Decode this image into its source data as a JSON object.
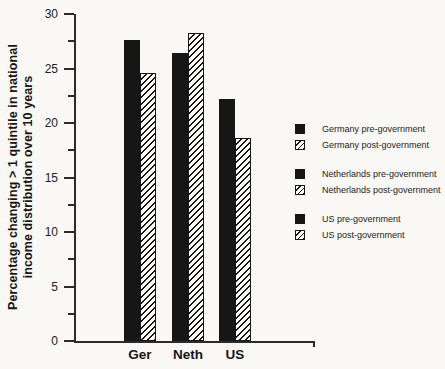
{
  "figure": {
    "paper_color": "#f9f8f5",
    "ink_color": "#161616",
    "axis_color": "#2b2b2b",
    "hatch_fill_color": "#fcfbf8"
  },
  "chart_data": {
    "type": "bar",
    "title": "",
    "ylabel_line1": "Percentage changing > 1 quintile in national",
    "ylabel_line2": "income distribution over 10 years",
    "xlabel": "",
    "categories": [
      "Ger",
      "Neth",
      "US"
    ],
    "series": [
      {
        "name": "pre-government",
        "style": "solid-black",
        "values": [
          27.6,
          26.4,
          22.2
        ]
      },
      {
        "name": "post-government",
        "style": "diagonal-hatch",
        "values": [
          24.6,
          28.3,
          18.6
        ]
      }
    ],
    "ylim": [
      0,
      30
    ],
    "yticks": [
      0,
      5,
      10,
      15,
      20,
      25,
      30
    ],
    "ytick_minor_step": 2.5,
    "grid": false,
    "legend_position": "right",
    "legend_groups": [
      {
        "items": [
          {
            "label": "Germany pre-government",
            "swatch": "solid-black"
          },
          {
            "label": "Germany post-government",
            "swatch": "diagonal-hatch"
          }
        ]
      },
      {
        "items": [
          {
            "label": "Netherlands pre-government",
            "swatch": "solid-black"
          },
          {
            "label": "Netherlands post-government",
            "swatch": "diagonal-hatch"
          }
        ]
      },
      {
        "items": [
          {
            "label": "US pre-government",
            "swatch": "solid-black"
          },
          {
            "label": "US post-government",
            "swatch": "diagonal-hatch"
          }
        ]
      }
    ]
  }
}
